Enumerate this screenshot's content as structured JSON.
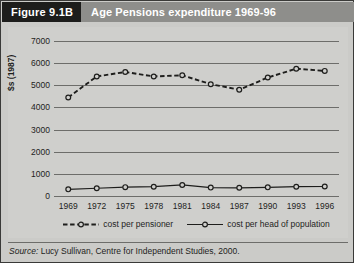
{
  "figure": {
    "badge": "Figure 9.1B",
    "title": "Age Pensions expenditure 1969-96"
  },
  "source": {
    "label": "Source:",
    "text": " Lucy Sullivan, Centre for Independent Studies, 2000."
  },
  "colors": {
    "panel_background": "#cfcfcc",
    "header_background": "#8e8e8b",
    "badge_background": "#1d1d1b",
    "grid": "#6d6d6a",
    "series": "#1e1e1c"
  },
  "chart_data": {
    "type": "line",
    "title": "Age Pensions expenditure 1969-96",
    "xlabel": "",
    "ylabel": "$s (1987)",
    "ylim": [
      0,
      7000
    ],
    "ytick_values": [
      7000,
      6000,
      5000,
      4000,
      3000,
      2000,
      1000,
      0
    ],
    "ytick_labels": [
      "7000",
      "6000",
      "5000",
      "4000",
      "3000",
      "2000",
      "1000",
      "0"
    ],
    "categories": [
      "1969",
      "1972",
      "1975",
      "1978",
      "1981",
      "1984",
      "1987",
      "1990",
      "1993",
      "1996"
    ],
    "x": [
      1969,
      1972,
      1975,
      1978,
      1981,
      1984,
      1987,
      1990,
      1993,
      1996
    ],
    "grid": "horizontal",
    "legend_position": "bottom",
    "series": [
      {
        "name": "cost per pensioner",
        "style": "dashed",
        "marker": "circle",
        "values": [
          4450,
          5400,
          5600,
          5400,
          5450,
          5050,
          4800,
          5350,
          5750,
          5650
        ]
      },
      {
        "name": "cost per head of population",
        "style": "solid",
        "marker": "circle",
        "values": [
          300,
          350,
          400,
          420,
          500,
          380,
          370,
          390,
          420,
          430
        ]
      }
    ]
  }
}
